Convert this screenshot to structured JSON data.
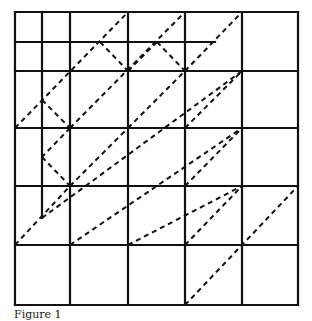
{
  "figure": {
    "caption": "Figure 1",
    "line_color": "#111111",
    "grid": {
      "columns_x": [
        15,
        70,
        128,
        185,
        242,
        298
      ],
      "rows_y": [
        12,
        71,
        128,
        186,
        245,
        305
      ],
      "partial_lines": [
        {
          "type": "vertical",
          "x": 42,
          "y1": 12,
          "y2": 218
        },
        {
          "type": "horizontal",
          "y": 42,
          "x1": 15,
          "x2": 215
        }
      ]
    },
    "dashed_segments": [
      [
        15,
        128,
        128,
        12
      ],
      [
        100,
        42,
        128,
        71
      ],
      [
        128,
        71,
        157,
        42
      ],
      [
        157,
        42,
        185,
        71
      ],
      [
        185,
        71,
        242,
        12
      ],
      [
        42,
        100,
        70,
        128
      ],
      [
        70,
        128,
        42,
        157
      ],
      [
        42,
        157,
        70,
        186
      ],
      [
        70,
        128,
        185,
        12
      ],
      [
        42,
        218,
        242,
        71
      ],
      [
        15,
        245,
        70,
        186
      ],
      [
        70,
        245,
        242,
        128
      ],
      [
        128,
        245,
        242,
        186
      ],
      [
        185,
        245,
        242,
        186
      ],
      [
        185,
        305,
        298,
        186
      ],
      [
        70,
        186,
        128,
        128
      ],
      [
        128,
        128,
        185,
        71
      ],
      [
        185,
        128,
        242,
        71
      ],
      [
        185,
        186,
        242,
        128
      ],
      [
        242,
        186,
        298,
        186
      ]
    ]
  }
}
